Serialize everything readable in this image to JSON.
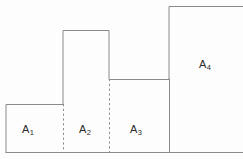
{
  "figure": {
    "type": "step-region-diagram",
    "background_color": "#fdfdfd",
    "stroke_color": "#8a8a8a",
    "stroke_width": 1,
    "label_color": "#2b2b2b",
    "canvas": {
      "width": 243,
      "height": 159
    },
    "baseline_y": 152,
    "regions": [
      {
        "id": "A1",
        "label_base": "A",
        "label_subscript": "1",
        "x_left": 6,
        "x_right": 63,
        "y_top": 104,
        "y_bottom": 152,
        "width": 57,
        "height": 48,
        "label_x": 22,
        "label_y": 123
      },
      {
        "id": "A2",
        "label_base": "A",
        "label_subscript": "2",
        "x_left": 63,
        "x_right": 109,
        "y_top": 30,
        "y_bottom": 152,
        "width": 46,
        "height": 122,
        "label_x": 79,
        "label_y": 123
      },
      {
        "id": "A3",
        "label_base": "A",
        "label_subscript": "3",
        "x_left": 109,
        "x_right": 169,
        "y_top": 79,
        "y_bottom": 152,
        "width": 60,
        "height": 73,
        "label_x": 130,
        "label_y": 123
      },
      {
        "id": "A4",
        "label_base": "A",
        "label_subscript": "4",
        "x_left": 169,
        "x_right": 243,
        "y_top": 6,
        "y_bottom": 152,
        "width": 74,
        "height": 146,
        "label_x": 199,
        "label_y": 58
      }
    ],
    "dividers": [
      {
        "id": "divider-a1-a2",
        "style": "dashed",
        "x": 63,
        "y_top": 104,
        "y_bottom": 152
      },
      {
        "id": "divider-a2-a3",
        "style": "dashed",
        "x": 109,
        "y_top": 79,
        "y_bottom": 152
      },
      {
        "id": "divider-a3-a4",
        "style": "solid",
        "x": 169,
        "y_top": 79,
        "y_bottom": 152
      }
    ],
    "outline_path": "M 6 152 L 6 104 L 63 104 L 63 30 L 109 30 L 109 79 L 169 79 L 169 6 L 243 6 M 6 152 L 243 152"
  }
}
